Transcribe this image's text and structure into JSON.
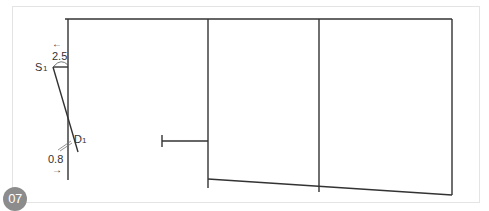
{
  "figure": {
    "step_badge": "07",
    "labels": {
      "point_s": "S",
      "point_s_sub": "1",
      "point_d": "D",
      "point_d_sub": "1",
      "measure_top": "2.5",
      "measure_bottom": "0.8",
      "arrow_top": "←",
      "arrow_bottom": "→"
    },
    "colors": {
      "line": "#333333",
      "badge_bg": "#8c8c8c",
      "panel_border": "#e4e4e4"
    }
  }
}
